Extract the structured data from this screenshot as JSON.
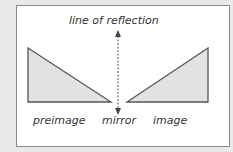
{
  "diagram": {
    "title_label": "line of reflection",
    "labels": {
      "preimage": "preimage",
      "mirror": "mirror",
      "image": "image"
    },
    "colors": {
      "triangle_fill": "#e2e2e2",
      "triangle_stroke": "#555555",
      "background": "#ffffff",
      "border": "#8a8a8a"
    }
  }
}
